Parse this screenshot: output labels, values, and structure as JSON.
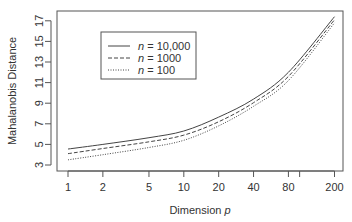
{
  "chart_data": {
    "type": "line",
    "title": "",
    "xlabel": "Dimension p",
    "xlabel_prefix": "Dimension ",
    "xlabel_var": "p",
    "ylabel": "Mahalanobis Distance",
    "x_scale": "log",
    "x_ticks": [
      1,
      2,
      5,
      10,
      20,
      40,
      80,
      100,
      200
    ],
    "x_tick_labels": [
      "1",
      "2",
      "5",
      "10",
      "20",
      "40",
      "80",
      "",
      "200"
    ],
    "y_ticks": [
      3,
      5,
      7,
      9,
      11,
      13,
      15,
      17
    ],
    "y_tick_labels": [
      "3",
      "5",
      "7",
      "9",
      "11",
      "13",
      "15",
      "17"
    ],
    "ylim": [
      2.5,
      18
    ],
    "grid": false,
    "legend_position": "top-left inset",
    "x": [
      1,
      2,
      5,
      10,
      20,
      40,
      80,
      200
    ],
    "series": [
      {
        "name": "n = 10,000",
        "var": "n",
        "value_label": "= 10,000",
        "style": "solid",
        "values": [
          4.55,
          5.0,
          5.65,
          6.3,
          7.65,
          9.4,
          12.0,
          17.4
        ]
      },
      {
        "name": "n = 1000",
        "var": "n",
        "value_label": "= 1000",
        "style": "dashed",
        "values": [
          4.1,
          4.6,
          5.25,
          5.9,
          7.2,
          9.05,
          11.6,
          17.1
        ]
      },
      {
        "name": "n = 100",
        "var": "n",
        "value_label": "= 100",
        "style": "dotted",
        "values": [
          3.5,
          4.0,
          4.7,
          5.4,
          6.8,
          8.7,
          11.2,
          16.8
        ]
      }
    ]
  },
  "colors": {
    "axis": "#555555",
    "line": "#444444",
    "text": "#333333",
    "background": "#ffffff"
  }
}
